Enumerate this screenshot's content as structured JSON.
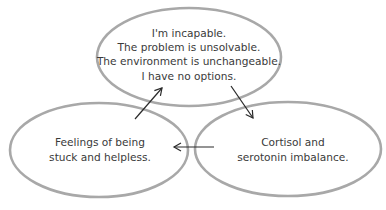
{
  "diagram": {
    "type": "cycle",
    "nodes": [
      {
        "id": "beliefs",
        "lines": [
          "I'm incapable.",
          "The problem is unsolvable.",
          "The environment is unchangeable.",
          "I have no options."
        ]
      },
      {
        "id": "biochemistry",
        "lines": [
          "Cortisol and",
          "serotonin imbalance."
        ]
      },
      {
        "id": "feelings",
        "lines": [
          "Feelings of being",
          "stuck and helpless."
        ]
      }
    ],
    "edges": [
      {
        "from": "beliefs",
        "to": "biochemistry"
      },
      {
        "from": "biochemistry",
        "to": "feelings"
      },
      {
        "from": "feelings",
        "to": "beliefs"
      }
    ],
    "colors": {
      "ellipse_stroke": "#a8a8a8",
      "arrow": "#2a2a2a",
      "text": "#3a3a3a",
      "background": "#ffffff"
    }
  }
}
